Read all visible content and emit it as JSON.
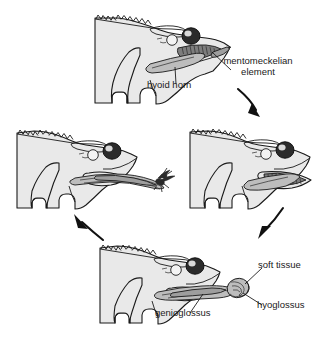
{
  "figure": {
    "type": "scientific-diagram",
    "background": "#ffffff",
    "panel_count": 4,
    "cycle_direction": "clockwise"
  },
  "labels": {
    "mentomeckelian_element": "mentomeckelian\nelement",
    "mentomeckelian_line1": "mentomeckelian",
    "mentomeckelian_line2": "element",
    "hyoid_horn": "hyoid horn",
    "soft_tissue": "soft tissue",
    "hyoglossus": "hyoglossus",
    "genioglossus": "genioglossus"
  },
  "panels": [
    {
      "id": "panel-top-mouth-closed",
      "position": "top-center",
      "stage": 1,
      "description": "Head with mouth closed, tongue retracted",
      "labels": [
        "mentomeckelian element",
        "hyoid horn"
      ]
    },
    {
      "id": "panel-right-mouth-open",
      "position": "middle-right",
      "stage": 2,
      "description": "Mouth opening, jaw dropped, tongue pad rotating forward",
      "labels": []
    },
    {
      "id": "panel-bottom-tongue-extending",
      "position": "bottom-center",
      "stage": 3,
      "description": "Tongue projected out of mouth, muscles labelled",
      "labels": [
        "soft tissue",
        "hyoglossus",
        "genioglossus"
      ]
    },
    {
      "id": "panel-left-tongue-capture",
      "position": "middle-left",
      "stage": 4,
      "description": "Tongue fully extended capturing a fly",
      "labels": []
    }
  ],
  "arrows": [
    {
      "id": "arrow-top-to-right",
      "from": "panel-top-mouth-closed",
      "to": "panel-right-mouth-open",
      "direction": "down-right"
    },
    {
      "id": "arrow-right-to-bottom",
      "from": "panel-right-mouth-open",
      "to": "panel-bottom-tongue-extending",
      "direction": "down-left"
    },
    {
      "id": "arrow-bottom-to-left",
      "from": "panel-bottom-tongue-extending",
      "to": "panel-left-tongue-capture",
      "direction": "up-left"
    }
  ],
  "colors": {
    "body_fill": "#e9e9e9",
    "outline": "#1a1a1a",
    "eye": "#2b2b2b",
    "tongue": "#bdbdbd",
    "mouth_interior": "#7d7d7d",
    "text": "#1a1a1a",
    "background": "#ffffff"
  }
}
